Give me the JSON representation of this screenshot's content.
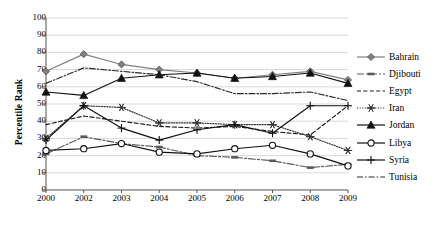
{
  "chart_data": {
    "type": "line",
    "title": "",
    "xlabel": "",
    "ylabel": "Percentile Rank",
    "categories": [
      "2000",
      "2002",
      "2003",
      "2004",
      "2005",
      "2006",
      "2007",
      "2008",
      "2009"
    ],
    "ylim": [
      0,
      100
    ],
    "ytick_labels": [
      "0",
      "10",
      "20",
      "30",
      "40",
      "50",
      "60",
      "70",
      "80",
      "90",
      "100"
    ],
    "grid": "horizontal",
    "legend_position": "right",
    "series": [
      {
        "name": "Bahrain",
        "marker": "diamond",
        "line": "solid",
        "color": "#808080",
        "values": [
          69,
          79,
          73,
          70,
          68,
          65,
          67,
          69,
          64
        ]
      },
      {
        "name": "Djibouti",
        "marker": "dash-bar",
        "line": "dash-dot-long",
        "color": "#595959",
        "values": [
          21,
          31,
          27,
          25,
          20,
          19,
          17,
          13,
          15
        ]
      },
      {
        "name": "Egypt",
        "marker": "none",
        "line": "dashed",
        "color": "#1a1a1a",
        "values": [
          38,
          43,
          40,
          37,
          36,
          37,
          34,
          32,
          49
        ]
      },
      {
        "name": "Iran",
        "marker": "asterisk",
        "line": "dotted",
        "color": "#333333",
        "values": [
          30,
          49,
          48,
          39,
          39,
          38,
          38,
          31,
          23
        ]
      },
      {
        "name": "Jordan",
        "marker": "triangle",
        "line": "solid",
        "color": "#111111",
        "values": [
          57,
          55,
          65,
          67,
          68,
          65,
          66,
          68,
          62
        ]
      },
      {
        "name": "Libya",
        "marker": "circle",
        "line": "solid",
        "color": "#111111",
        "values": [
          23,
          24,
          27,
          22,
          21,
          24,
          26,
          21,
          14
        ]
      },
      {
        "name": "Syria",
        "marker": "plus",
        "line": "solid",
        "color": "#111111",
        "values": [
          29,
          49,
          36,
          29,
          35,
          38,
          33,
          49,
          49
        ]
      },
      {
        "name": "Tunisia",
        "marker": "none",
        "line": "dash-dot",
        "color": "#2b2b2b",
        "values": [
          62,
          71,
          69,
          67,
          63,
          56,
          56,
          57,
          52
        ]
      }
    ]
  },
  "legend": {
    "items": [
      {
        "label": "Bahrain"
      },
      {
        "label": "Djibouti"
      },
      {
        "label": "Egypt"
      },
      {
        "label": "Iran"
      },
      {
        "label": "Jordan"
      },
      {
        "label": "Libya"
      },
      {
        "label": "Syria"
      },
      {
        "label": "Tunisia"
      }
    ]
  }
}
